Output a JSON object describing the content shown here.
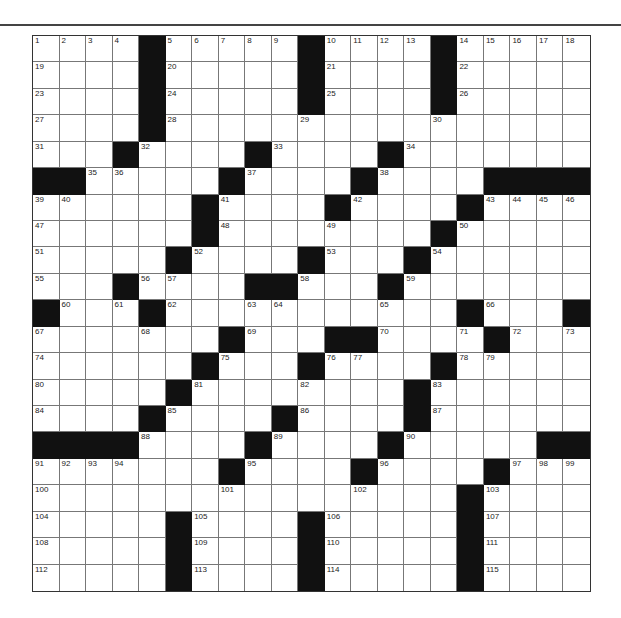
{
  "puzzle": {
    "rows": 21,
    "cols": 21,
    "grid": [
      [
        "1",
        "2",
        "3",
        "4",
        "#",
        "5",
        "6",
        "7",
        "8",
        "9",
        "#",
        "10",
        "11",
        "12",
        "13",
        "#",
        "14",
        "15",
        "16",
        "17",
        "18"
      ],
      [
        "19",
        "",
        "",
        "",
        "#",
        "20",
        "",
        "",
        "",
        "",
        "#",
        "21",
        "",
        "",
        "",
        "#",
        "22",
        "",
        "",
        "",
        ""
      ],
      [
        "23",
        "",
        "",
        "",
        "#",
        "24",
        "",
        "",
        "",
        "",
        "#",
        "25",
        "",
        "",
        "",
        "#",
        "26",
        "",
        "",
        "",
        ""
      ],
      [
        "27",
        "",
        "",
        "",
        "#",
        "28",
        "",
        "",
        "",
        "",
        "29",
        "",
        "",
        "",
        "",
        "30",
        "",
        "",
        "",
        "",
        ""
      ],
      [
        "31",
        "",
        "",
        "#",
        "32",
        "",
        "",
        "",
        "#",
        "33",
        "",
        "",
        "",
        "#",
        "34",
        "",
        "",
        "",
        "",
        "",
        ""
      ],
      [
        "#",
        "#",
        "35",
        "36",
        "",
        "",
        "",
        "#",
        "37",
        "",
        "",
        "",
        "#",
        "38",
        "",
        "",
        "",
        "#",
        "#",
        "#",
        "#"
      ],
      [
        "39",
        "40",
        "",
        "",
        "",
        "",
        "#",
        "41",
        "",
        "",
        "",
        "#",
        "42",
        "",
        "",
        "",
        "#",
        "43",
        "44",
        "45",
        "46"
      ],
      [
        "47",
        "",
        "",
        "",
        "",
        "",
        "#",
        "48",
        "",
        "",
        "",
        "49",
        "",
        "",
        "",
        "#",
        "50",
        "",
        "",
        "",
        ""
      ],
      [
        "51",
        "",
        "",
        "",
        "",
        "#",
        "52",
        "",
        "",
        "",
        "#",
        "53",
        "",
        "",
        "#",
        "54",
        "",
        "",
        "",
        "",
        ""
      ],
      [
        "55",
        "",
        "",
        "#",
        "56",
        "57",
        "",
        "",
        "#",
        "#",
        "58",
        "",
        "",
        "#",
        "59",
        "",
        "",
        "",
        "",
        "",
        ""
      ],
      [
        "#",
        "60",
        "",
        "61",
        "#",
        "62",
        "",
        "",
        "63",
        "64",
        "",
        "",
        "",
        "65",
        "",
        "",
        "#",
        "66",
        "",
        "",
        "#"
      ],
      [
        "67",
        "",
        "",
        "",
        "68",
        "",
        "",
        "#",
        "69",
        "",
        "",
        "#",
        "#",
        "70",
        "",
        "",
        "71",
        "#",
        "72",
        "",
        "73"
      ],
      [
        "74",
        "",
        "",
        "",
        "",
        "",
        "#",
        "75",
        "",
        "",
        "#",
        "76",
        "77",
        "",
        "",
        "#",
        "78",
        "79",
        "",
        "",
        ""
      ],
      [
        "80",
        "",
        "",
        "",
        "",
        "#",
        "81",
        "",
        "",
        "",
        "82",
        "",
        "",
        "",
        "#",
        "83",
        "",
        "",
        "",
        "",
        ""
      ],
      [
        "84",
        "",
        "",
        "",
        "#",
        "85",
        "",
        "",
        "",
        "#",
        "86",
        "",
        "",
        "",
        "#",
        "87",
        "",
        "",
        "",
        "",
        ""
      ],
      [
        "#",
        "#",
        "#",
        "#",
        "88",
        "",
        "",
        "",
        "#",
        "89",
        "",
        "",
        "",
        "#",
        "90",
        "",
        "",
        "",
        "",
        "#",
        "#"
      ],
      [
        "91",
        "92",
        "93",
        "94",
        "",
        "",
        "",
        "#",
        "95",
        "",
        "",
        "",
        "#",
        "96",
        "",
        "",
        "",
        "#",
        "97",
        "98",
        "99"
      ],
      [
        "100",
        "",
        "",
        "",
        "",
        "",
        "",
        "101",
        "",
        "",
        "",
        "",
        "102",
        "",
        "",
        "",
        "#",
        "103",
        "",
        "",
        ""
      ],
      [
        "104",
        "",
        "",
        "",
        "",
        "#",
        "105",
        "",
        "",
        "",
        "#",
        "106",
        "",
        "",
        "",
        "",
        "#",
        "107",
        "",
        "",
        ""
      ],
      [
        "108",
        "",
        "",
        "",
        "",
        "#",
        "109",
        "",
        "",
        "",
        "#",
        "110",
        "",
        "",
        "",
        "",
        "#",
        "111",
        "",
        "",
        ""
      ],
      [
        "112",
        "",
        "",
        "",
        "",
        "#",
        "113",
        "",
        "",
        "",
        "#",
        "114",
        "",
        "",
        "",
        "",
        "#",
        "115",
        "",
        "",
        ""
      ]
    ]
  }
}
